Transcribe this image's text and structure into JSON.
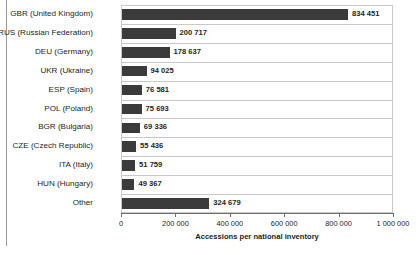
{
  "chart_data": {
    "type": "bar",
    "orientation": "horizontal",
    "title": "",
    "xlabel": "Accessions per national inventory",
    "ylabel": "",
    "xlim": [
      0,
      1000000
    ],
    "grid": true,
    "legend": null,
    "categories": [
      "GBR (United Kingdom)",
      "RUS (Russian Federation)",
      "DEU (Germany)",
      "UKR (Ukraine)",
      "ESP (Spain)",
      "POL (Poland)",
      "BGR (Bulgaria)",
      "CZE (Czech Republic)",
      "ITA (Italy)",
      "HUN (Hungary)",
      "Other"
    ],
    "values": [
      834451,
      200717,
      178637,
      94025,
      76581,
      75693,
      69336,
      55436,
      51759,
      49367,
      324679
    ],
    "value_labels": [
      "834 451",
      "200 717",
      "178 637",
      "94 025",
      "76 581",
      "75 693",
      "69 336",
      "55 436",
      "51 759",
      "49 367",
      "324 679"
    ],
    "xticks": [
      0,
      200000,
      400000,
      600000,
      800000,
      1000000
    ],
    "xtick_labels": [
      "0",
      "200 000",
      "400 000",
      "600 000",
      "800 000",
      "1 000 000"
    ],
    "bar_color": "#3b3b3b",
    "gridline_color": "#c8c8c8",
    "text_color": "#231f20"
  }
}
